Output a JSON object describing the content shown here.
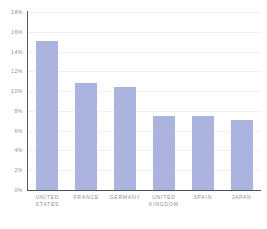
{
  "chart_data": {
    "type": "bar",
    "title": "",
    "subtitle": "",
    "xlabel": "",
    "ylabel": "",
    "categories": [
      "UNITED STATES",
      "FRANCE",
      "GERMANY",
      "UNITED KINGDOM",
      "SPAIN",
      "JAPAN"
    ],
    "category_lines": [
      [
        "UNITED",
        "STATES"
      ],
      [
        "FRANCE"
      ],
      [
        "GERMANY"
      ],
      [
        "UNITED",
        "KINGDOM"
      ],
      [
        "SPAIN"
      ],
      [
        "JAPAN"
      ]
    ],
    "values": [
      15.1,
      10.8,
      10.4,
      7.5,
      7.5,
      7.1
    ],
    "value_unit": "%",
    "ylim": [
      0,
      18
    ],
    "ytick_values": [
      0,
      2,
      4,
      6,
      8,
      10,
      12,
      14,
      16,
      18
    ],
    "ytick_labels": [
      "0%",
      "2%",
      "4%",
      "6%",
      "8%",
      "10%",
      "12%",
      "14%",
      "16%",
      "18%"
    ],
    "grid": true,
    "grid_axis": "y",
    "legend": false,
    "legend_position": "none",
    "series": [
      {
        "name": "",
        "values": [
          15.1,
          10.8,
          10.4,
          7.5,
          7.5,
          7.1
        ]
      }
    ]
  },
  "style": {
    "bar_color": "#aab4de",
    "gridline_color": "#eef0f5",
    "axis_color": "#565a63",
    "tick_label_color": "#8d8f96",
    "background_color": "#ffffff"
  }
}
